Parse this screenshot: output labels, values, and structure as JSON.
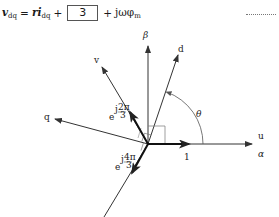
{
  "equation": {
    "lhs_symbol": "v",
    "lhs_sub": "dq",
    "equals": "=",
    "term1_coef": "r",
    "term1_symbol": "i",
    "term1_sub": "dq",
    "plus1": "+",
    "blank_value": "3",
    "plus2": "+",
    "term3": "jωφ",
    "term3_sub": "m"
  },
  "trailing_dots": "..........",
  "diagram": {
    "axes": {
      "alpha": "α",
      "beta": "β",
      "u": "u",
      "v": "v",
      "d": "d",
      "q": "q"
    },
    "angle_label": "θ",
    "unit_vector_label": "1",
    "phasor_2pi3": {
      "base": "e",
      "exp_j": "j",
      "exp_num": "2π",
      "exp_den": "3"
    },
    "phasor_4pi3": {
      "base": "e",
      "exp_j": "j",
      "exp_num": "4π",
      "exp_den": "3"
    },
    "colors": {
      "line": "#333333",
      "thin_line": "#555555",
      "background": "#ffffff"
    }
  }
}
